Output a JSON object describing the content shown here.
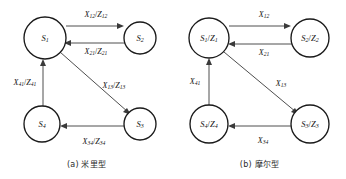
{
  "figure": {
    "panels": [
      {
        "id": "mealy",
        "caption": "(a) 米里型",
        "nodes": [
          {
            "id": "s1",
            "label": "S",
            "sub": "1",
            "cx": 45,
            "cy": 38,
            "r": 21
          },
          {
            "id": "s2",
            "label": "S",
            "sub": "2",
            "cx": 140,
            "cy": 38,
            "r": 16
          },
          {
            "id": "s3",
            "label": "S",
            "sub": "3",
            "cx": 140,
            "cy": 124,
            "r": 16
          },
          {
            "id": "s4",
            "label": "S",
            "sub": "4",
            "cx": 42,
            "cy": 124,
            "r": 18
          }
        ],
        "edges": [
          {
            "id": "e12",
            "from": "s1",
            "to": "s2",
            "input": "X",
            "input_sub": "12",
            "output": "Z",
            "output_sub": "12",
            "label_x": 96,
            "label_y": 14
          },
          {
            "id": "e21",
            "from": "s2",
            "to": "s1",
            "input": "X",
            "input_sub": "21",
            "output": "Z",
            "output_sub": "21",
            "label_x": 96,
            "label_y": 51
          },
          {
            "id": "e13",
            "from": "s1",
            "to": "s3",
            "input": "X",
            "input_sub": "13",
            "output": "Z",
            "output_sub": "13",
            "label_x": 114,
            "label_y": 85
          },
          {
            "id": "e34",
            "from": "s3",
            "to": "s4",
            "input": "X",
            "input_sub": "34",
            "output": "Z",
            "output_sub": "34",
            "label_x": 94,
            "label_y": 141
          },
          {
            "id": "e41",
            "from": "s4",
            "to": "s1",
            "input": "X",
            "input_sub": "41",
            "output": "Z",
            "output_sub": "41",
            "label_x": 25,
            "label_y": 82
          }
        ]
      },
      {
        "id": "moore",
        "caption": "(b) 摩尔型",
        "nodes": [
          {
            "id": "s1",
            "label": "S",
            "sub": "1",
            "out": "Z",
            "out_sub": "1",
            "cx": 36,
            "cy": 38,
            "r": 20
          },
          {
            "id": "s2",
            "label": "S",
            "sub": "2",
            "out": "Z",
            "out_sub": "2",
            "cx": 137,
            "cy": 38,
            "r": 19
          },
          {
            "id": "s3",
            "label": "S",
            "sub": "3",
            "out": "Z",
            "out_sub": "3",
            "cx": 137,
            "cy": 124,
            "r": 19
          },
          {
            "id": "s4",
            "label": "S",
            "sub": "4",
            "out": "Z",
            "out_sub": "4",
            "cx": 36,
            "cy": 124,
            "r": 19
          }
        ],
        "edges": [
          {
            "id": "e12",
            "from": "s1",
            "to": "s2",
            "input": "X",
            "input_sub": "12",
            "label_x": 91,
            "label_y": 14
          },
          {
            "id": "e21",
            "from": "s2",
            "to": "s1",
            "input": "X",
            "input_sub": "21",
            "label_x": 91,
            "label_y": 52
          },
          {
            "id": "e13",
            "from": "s1",
            "to": "s3",
            "input": "X",
            "input_sub": "13",
            "label_x": 108,
            "label_y": 83
          },
          {
            "id": "e34",
            "from": "s3",
            "to": "s4",
            "input": "X",
            "input_sub": "34",
            "label_x": 90,
            "label_y": 140
          },
          {
            "id": "e41",
            "from": "s4",
            "to": "s1",
            "input": "X",
            "input_sub": "41",
            "label_x": 22,
            "label_y": 81
          }
        ]
      }
    ]
  }
}
